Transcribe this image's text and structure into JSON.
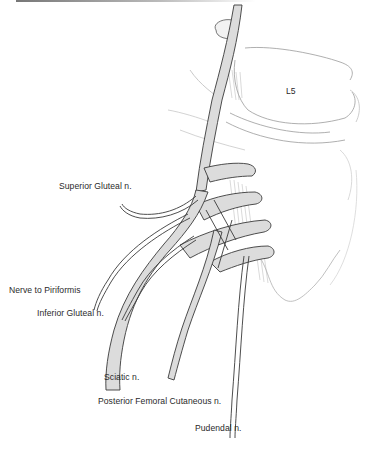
{
  "figure": {
    "vertebra_label": "L5",
    "labels": {
      "superior_gluteal": "Superior Gluteal n.",
      "nerve_to_piriformis": "Nerve to Piriformis",
      "inferior_gluteal": "Inferior Gluteal n.",
      "sciatic": "Sciatic n.",
      "posterior_femoral_cutaneous": "Posterior Femoral Cutaneous n.",
      "pudendal": "Pudendal n."
    },
    "colors": {
      "nerve_fill": "#dcdcdc",
      "outline": "#3a3a3a",
      "bone_sketch": "#9a9a9a"
    }
  }
}
